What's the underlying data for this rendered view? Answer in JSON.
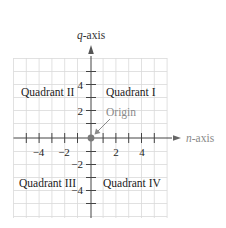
{
  "diagram": {
    "type": "coordinate-plane",
    "axes": {
      "horizontal_label_var": "n",
      "horizontal_label_rest": "-axis",
      "vertical_label_var": "q",
      "vertical_label_rest": "-axis"
    },
    "ticks": {
      "x_labels": [
        "−4",
        "−2",
        "2",
        "4"
      ],
      "y_labels": [
        "4",
        "2",
        "−2",
        "−4"
      ]
    },
    "quadrants": {
      "q1": "Quadrant I",
      "q2": "Quadrant II",
      "q3": "Quadrant III",
      "q4": "Quadrant IV"
    },
    "origin_label": "Origin",
    "colors": {
      "grid": "#d9d9d9",
      "axis": "#444444",
      "text": "#222222",
      "muted": "#8a8a8a",
      "origin_dot": "#7a7a7a"
    }
  }
}
